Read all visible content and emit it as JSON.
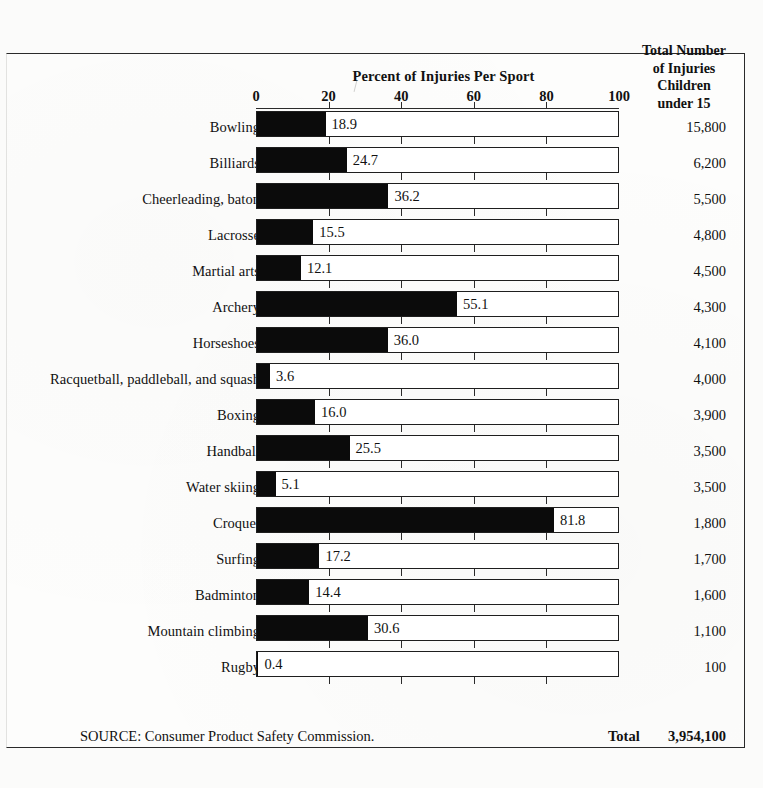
{
  "header": {
    "chart_title": "Percent of Injuries Per Sport",
    "right_column_lines": [
      "Total Number",
      "of Injuries",
      "Children",
      "under 15"
    ]
  },
  "axis": {
    "ticks": [
      "0",
      "20",
      "40",
      "60",
      "80",
      "100"
    ]
  },
  "footer": {
    "source": "SOURCE: Consumer Product Safety Commission.",
    "total_label": "Total",
    "total_value": "3,954,100"
  },
  "chart_data": {
    "type": "bar",
    "orientation": "horizontal",
    "title": "Percent of Injuries Per Sport",
    "xlabel": "Percent of Injuries Per Sport",
    "ylabel": "",
    "xlim": [
      0,
      100
    ],
    "grid": false,
    "legend": "none",
    "tick_labels": [
      "0",
      "20",
      "40",
      "60",
      "80",
      "100"
    ],
    "categories": [
      "Bowling",
      "Billiards",
      "Cheerleading, baton",
      "Lacrosse",
      "Martial arts",
      "Archery",
      "Horseshoes",
      "Racquetball, paddleball, and squash",
      "Boxing",
      "Handball",
      "Water skiing",
      "Croquet",
      "Surfing",
      "Badminton",
      "Mountain climbing",
      "Rugby"
    ],
    "values": [
      18.9,
      24.7,
      36.2,
      15.5,
      12.1,
      55.1,
      36.0,
      3.6,
      16.0,
      25.5,
      5.1,
      81.8,
      17.2,
      14.4,
      30.6,
      0.4
    ],
    "value_labels": [
      "18.9",
      "24.7",
      "36.2",
      "15.5",
      "12.1",
      "55.1",
      "36.0",
      "3.6",
      "16.0",
      "25.5",
      "5.1",
      "81.8",
      "17.2",
      "14.4",
      "30.6",
      "0.4"
    ],
    "secondary_series": {
      "name": "Total Number of Injuries Children under 15",
      "labels": [
        "15,800",
        "6,200",
        "5,500",
        "4,800",
        "4,500",
        "4,300",
        "4,100",
        "4,000",
        "3,900",
        "3,500",
        "3,500",
        "1,800",
        "1,700",
        "1,600",
        "1,100",
        "100"
      ],
      "values": [
        15800,
        6200,
        5500,
        4800,
        4500,
        4300,
        4100,
        4000,
        3900,
        3500,
        3500,
        1800,
        1700,
        1600,
        1100,
        100
      ],
      "total_label": "Total",
      "total": "3,954,100"
    },
    "source": "SOURCE: Consumer Product Safety Commission.",
    "colors": {
      "bar_fill": "#0b0b0b",
      "bar_track": "#ffffff",
      "bar_border": "#1e1e1e",
      "text": "#111111"
    }
  }
}
